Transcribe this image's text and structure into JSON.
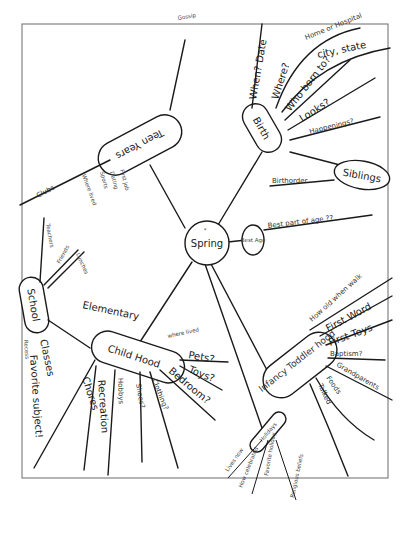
{
  "diagram": {
    "type": "hand-drawn mind map",
    "center": {
      "label": "Spring",
      "mark": "*"
    },
    "branches": {
      "birth": {
        "label": "Birth",
        "children": [
          "When? Date",
          "Where?",
          "Home or Hospital",
          "city, state",
          "Who born to?",
          "Looks?",
          "Happenings?"
        ]
      },
      "siblings": {
        "label": "Siblings",
        "children": [
          "Birthorder"
        ]
      },
      "bestage": {
        "label": "Best Age",
        "children": [
          "Best part of age ??"
        ]
      },
      "infancy": {
        "label": "Infancy Toddler hood",
        "children": [
          "How old when walk",
          "First Word",
          "First Toys",
          "Baptism?",
          "Grandparents",
          "Foods",
          "Talked"
        ]
      },
      "childhood": {
        "label": "Child Hood",
        "children": [
          "where lived",
          "Pets?",
          "Toys?",
          "Bedroom?",
          "Clothing?",
          "Shoes?",
          "Hobbys",
          "Recreation",
          "Chores"
        ]
      },
      "school": {
        "label": "School",
        "children": [
          "Elementary",
          "Classes",
          "Favorite subject!",
          "Friends",
          "Teachers",
          "Lunches",
          "Recess"
        ]
      },
      "teen": {
        "label": "Teen Years",
        "children": [
          "Clubs",
          "Where lived",
          "Sports",
          "Dating",
          "First job",
          "Dances",
          "Gossip"
        ]
      },
      "holidays": {
        "label": "Holidays",
        "children": [
          "Lives now",
          "How celebrated",
          "Favorite holiday",
          "Religious beliefs"
        ]
      }
    }
  }
}
